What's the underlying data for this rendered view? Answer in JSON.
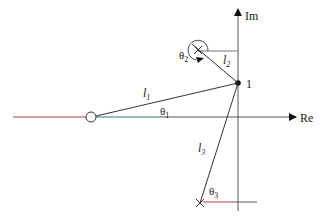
{
  "diagram": {
    "type": "pole-zero s-plane vector diagram",
    "axes": {
      "real_label": "Re",
      "imag_label": "Im"
    },
    "test_point": {
      "label": "1"
    },
    "vectors": [
      {
        "name": "l1",
        "label": "l",
        "sub": "1"
      },
      {
        "name": "l2",
        "label": "l",
        "sub": "2"
      },
      {
        "name": "l3",
        "label": "l",
        "sub": "3"
      }
    ],
    "angles": [
      {
        "name": "theta1",
        "label": "θ",
        "sub": "1"
      },
      {
        "name": "theta2",
        "label": "θ",
        "sub": "2"
      },
      {
        "name": "theta3",
        "label": "θ",
        "sub": "3"
      }
    ],
    "markers": {
      "zero": "circle (zero)",
      "poles": [
        "upper pole (×)",
        "lower pole (×)"
      ]
    },
    "colors": {
      "line": "#333333",
      "locus_red": "#c0394a",
      "locus_teal": "#2a7a72",
      "axis": "#555555"
    }
  }
}
